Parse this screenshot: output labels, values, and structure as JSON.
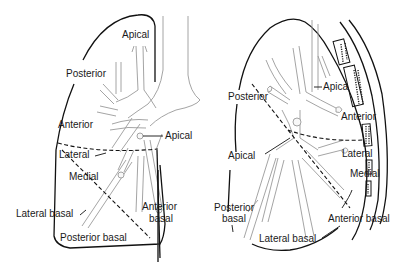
{
  "figure": {
    "colors": {
      "outline": "#111111",
      "bronchus_stroke": "#9a9a9a",
      "bronchus_fill": "#f8f8f8",
      "background": "#ffffff"
    }
  },
  "left_view": {
    "labels": {
      "apical_upper": "Apical",
      "posterior": "Posterior",
      "anterior": "Anterior",
      "apical_lower": "Apical",
      "lateral": "Lateral",
      "medial": "Medial",
      "lateral_basal": "Lateral basal",
      "anterior_basal_1": "Anterior",
      "anterior_basal_2": "basal",
      "posterior_basal": "Posterior basal"
    }
  },
  "right_view": {
    "labels": {
      "posterior": "Posterior",
      "apical_upper": "Apica",
      "anterior": "Anterior",
      "apical_lower": "Apical",
      "lateral": "Lateral",
      "medial": "Medial",
      "posterior_basal_1": "Posterior",
      "posterior_basal_2": "basal",
      "anterior_basal": "Anterior basal",
      "lateral_basal": "Lateral basal"
    }
  }
}
